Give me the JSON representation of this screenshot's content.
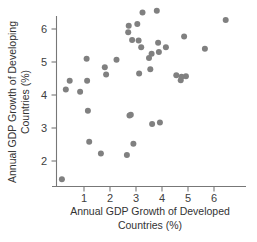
{
  "chart_data": {
    "type": "scatter",
    "title": "",
    "xlabel": "Annual GDP Growth of Developed Countries (%)",
    "ylabel": "Annual GDP Growth of Developing Countries (%)",
    "xlabel_line1": "Annual GDP Growth of Developed",
    "xlabel_line2": "Countries (%)",
    "ylabel_line1": "Annual GDP Growth of Developing",
    "ylabel_line2": "Countries (%)",
    "xlim": [
      0.0,
      6.9
    ],
    "ylim": [
      1.2,
      6.75
    ],
    "xticks": [
      1,
      2,
      3,
      4,
      5,
      6
    ],
    "yticks": [
      2,
      3,
      4,
      5,
      6
    ],
    "xtick_labels": [
      "1",
      "2",
      "3",
      "4",
      "5",
      "6"
    ],
    "ytick_labels": [
      "2",
      "3",
      "4",
      "5",
      "6"
    ],
    "grid": false,
    "legend": false,
    "marker_color": "#808080",
    "marker_size": 3.0,
    "axis_color": "#777777",
    "points": [
      [
        0.15,
        1.45
      ],
      [
        0.3,
        4.17
      ],
      [
        0.45,
        4.43
      ],
      [
        0.85,
        4.1
      ],
      [
        1.1,
        5.1
      ],
      [
        1.12,
        4.43
      ],
      [
        1.15,
        3.52
      ],
      [
        1.2,
        2.58
      ],
      [
        1.65,
        2.23
      ],
      [
        1.8,
        4.84
      ],
      [
        1.85,
        4.62
      ],
      [
        2.25,
        5.07
      ],
      [
        2.65,
        2.18
      ],
      [
        2.7,
        5.9
      ],
      [
        2.72,
        6.1
      ],
      [
        2.75,
        3.38
      ],
      [
        2.8,
        3.4
      ],
      [
        2.85,
        5.67
      ],
      [
        2.9,
        2.52
      ],
      [
        3.05,
        6.15
      ],
      [
        3.1,
        5.65
      ],
      [
        3.12,
        4.65
      ],
      [
        3.2,
        5.45
      ],
      [
        3.25,
        6.5
      ],
      [
        3.5,
        5.12
      ],
      [
        3.55,
        4.78
      ],
      [
        3.6,
        5.25
      ],
      [
        3.62,
        3.12
      ],
      [
        3.8,
        6.55
      ],
      [
        3.85,
        5.58
      ],
      [
        3.88,
        5.3
      ],
      [
        3.92,
        3.17
      ],
      [
        4.15,
        5.45
      ],
      [
        4.55,
        4.6
      ],
      [
        4.72,
        4.45
      ],
      [
        4.75,
        4.55
      ],
      [
        4.85,
        5.77
      ],
      [
        4.92,
        4.57
      ],
      [
        5.65,
        5.4
      ],
      [
        6.45,
        6.27
      ]
    ]
  }
}
